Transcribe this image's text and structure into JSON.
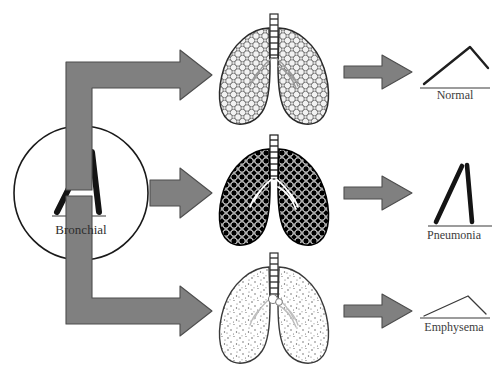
{
  "figure": {
    "background_color": "#ffffff",
    "arrow_color": "#808080",
    "arrow_outline_color": "#4a4a4a",
    "ink_color": "#1a1a1a"
  },
  "source": {
    "label": "Bronchial",
    "icon": "bronchial-waveform-icon",
    "shape": "inverted-v-peak",
    "description": "Thick inverted-V waveform inside a circle representing the bronchial breath sound at its source"
  },
  "rows": [
    {
      "id": "normal",
      "lung": {
        "name": "normal-lung-icon",
        "texture": "open-alveoli-circles",
        "fill_description": "light honeycomb of open circles, air filled",
        "fill_color": "#e8e8e8",
        "stroke_color": "#2a2a2a"
      },
      "result": {
        "label": "Normal",
        "waveform": "gradual-rise-steep-fall",
        "stroke_width": 2.4,
        "amplitude": "medium",
        "points": "0,46 46,10 64,30"
      }
    },
    {
      "id": "pneumonia",
      "lung": {
        "name": "pneumonia-lung-icon",
        "texture": "consolidated-dark-alveoli",
        "fill_description": "dense dark filled alveoli, consolidated lung",
        "fill_color": "#111111",
        "stroke_color": "#000000"
      },
      "result": {
        "label": "Pneumonia",
        "waveform": "tall-narrow-peak",
        "stroke_width": 4.6,
        "amplitude": "high",
        "points": "0,62 32,2 42,62"
      }
    },
    {
      "id": "emphysema",
      "lung": {
        "name": "emphysema-lung-icon",
        "texture": "sparse-stipple",
        "fill_description": "sparse fine stipple, hyperinflated lung with destroyed alveoli",
        "fill_color": "#fbfbfb",
        "stroke_color": "#3a3a3a"
      },
      "result": {
        "label": "Emphysema",
        "waveform": "low-flat-peak",
        "stroke_width": 1.3,
        "amplitude": "low",
        "points": "0,34 44,10 62,30"
      }
    }
  ],
  "arrows": {
    "source_to_lung": [
      {
        "name": "arrow-source-to-normal-lung",
        "path": "elbow-up-then-right"
      },
      {
        "name": "arrow-source-to-pneumonia-lung",
        "path": "straight-right"
      },
      {
        "name": "arrow-source-to-emphysema-lung",
        "path": "elbow-down-then-right"
      }
    ],
    "lung_to_result": [
      {
        "name": "arrow-normal-lung-to-waveform",
        "path": "straight-right"
      },
      {
        "name": "arrow-pneumonia-lung-to-waveform",
        "path": "straight-right"
      },
      {
        "name": "arrow-emphysema-lung-to-waveform",
        "path": "straight-right"
      }
    ]
  }
}
